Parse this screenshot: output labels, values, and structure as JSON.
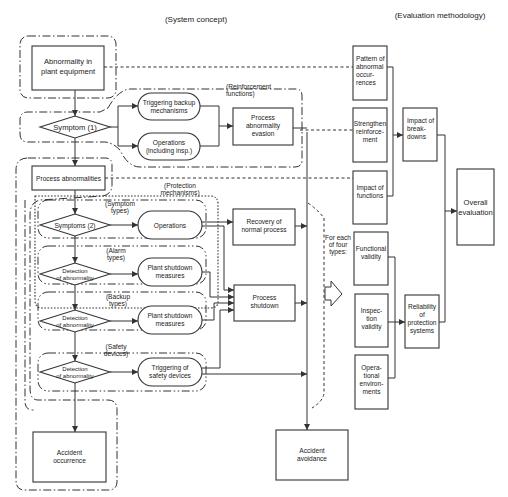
{
  "headers": {
    "system_concept": "(System concept)",
    "evaluation_methodology": "(Evaluation methodology)"
  },
  "system": {
    "abnormality_equipment": [
      "Abnormality in",
      "plant equipment"
    ],
    "symptom1": "Symptom (1)",
    "reinforcement_label": [
      "(Reinforcement",
      "functions)"
    ],
    "triggering_backup": [
      "Triggering backup",
      "mechanisms"
    ],
    "operations_insp": [
      "Operations",
      "(including insp.)"
    ],
    "process_abnormality_evasion": [
      "Process",
      "abnormality",
      "evasion"
    ],
    "process_abnormalities": "Process abnormalities",
    "protection_label": [
      "(Protection",
      "mechanisms)"
    ],
    "symptom_types_label": [
      "(Symptom",
      "types)"
    ],
    "symptoms2": "Symptoms (2)",
    "operations": "Operations",
    "recovery": [
      "Recovery of",
      "normal process"
    ],
    "alarm_types_label": [
      "(Alarm",
      "types)"
    ],
    "detection1": [
      "Detection",
      "of abnormality"
    ],
    "plant_shutdown1": [
      "Plant shutdown",
      "measures"
    ],
    "backup_types_label": [
      "(Backup",
      "types)"
    ],
    "detection2": [
      "Detection",
      "of abnormality"
    ],
    "plant_shutdown2": [
      "Plant shutdown",
      "measures"
    ],
    "process_shutdown": [
      "Process",
      "shutdown"
    ],
    "safety_devices_label": [
      "(Safety",
      "devices)"
    ],
    "detection3": [
      "Detection",
      "of abnormality"
    ],
    "triggering_safety": [
      "Triggering of",
      "safety devices"
    ],
    "accident_occurrence": [
      "Accident",
      "occurrence"
    ],
    "accident_avoidance": [
      "Accident",
      "avoidance"
    ],
    "for_each": [
      "For each",
      "of four",
      "types:"
    ]
  },
  "evaluation": {
    "pattern": [
      "Pattern of",
      "abnormal",
      "occur-",
      "rences"
    ],
    "strengthen": [
      "Strengthen",
      "reinforce-",
      "ment"
    ],
    "impact_functions": [
      "Impact of",
      "functions"
    ],
    "impact_breakdowns": [
      "Impact of",
      "break-",
      "downs"
    ],
    "overall": [
      "Overall",
      "evaluation"
    ],
    "functional_validity": [
      "Functional",
      "validity"
    ],
    "inspection_validity": [
      "Inspec-",
      "tion",
      "validity"
    ],
    "operational_env": [
      "Opera-",
      "tional",
      "environ-",
      "ments"
    ],
    "reliability": [
      "Reliability",
      "of",
      "protection",
      "systems"
    ]
  }
}
